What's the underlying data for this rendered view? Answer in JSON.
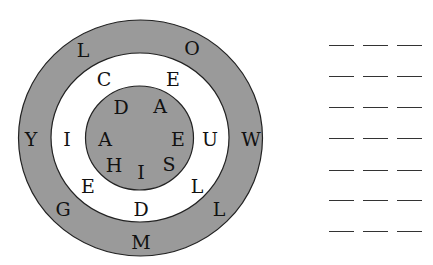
{
  "puzzle": {
    "rings": [
      {
        "name": "outer-ring",
        "cx": 140.5,
        "cy": 138,
        "rx": 122,
        "ry": 118,
        "fill": "#9a9a9a"
      },
      {
        "name": "middle-ring",
        "cx": 140,
        "cy": 137.5,
        "rx": 89,
        "ry": 84.5,
        "fill": "#ffffff"
      },
      {
        "name": "inner-circle",
        "cx": 139.5,
        "cy": 138,
        "rx": 54,
        "ry": 52,
        "fill": "#9a9a9a"
      }
    ],
    "letters": [
      {
        "ch": "L",
        "x": 83,
        "y": 50,
        "ring": "outer"
      },
      {
        "ch": "O",
        "x": 192,
        "y": 48,
        "ring": "outer"
      },
      {
        "ch": "W",
        "x": 251,
        "y": 139,
        "ring": "outer"
      },
      {
        "ch": "L",
        "x": 219,
        "y": 209,
        "ring": "outer"
      },
      {
        "ch": "M",
        "x": 141,
        "y": 242,
        "ring": "outer"
      },
      {
        "ch": "G",
        "x": 63,
        "y": 209,
        "ring": "outer"
      },
      {
        "ch": "Y",
        "x": 31,
        "y": 139,
        "ring": "outer"
      },
      {
        "ch": "C",
        "x": 104,
        "y": 79,
        "ring": "middle"
      },
      {
        "ch": "E",
        "x": 173,
        "y": 79,
        "ring": "middle"
      },
      {
        "ch": "U",
        "x": 210,
        "y": 139,
        "ring": "middle"
      },
      {
        "ch": "L",
        "x": 197,
        "y": 186,
        "ring": "middle"
      },
      {
        "ch": "D",
        "x": 141,
        "y": 209,
        "ring": "middle"
      },
      {
        "ch": "E",
        "x": 88,
        "y": 186,
        "ring": "middle"
      },
      {
        "ch": "I",
        "x": 67,
        "y": 139,
        "ring": "middle"
      },
      {
        "ch": "D",
        "x": 121,
        "y": 107,
        "ring": "inner"
      },
      {
        "ch": "A",
        "x": 160,
        "y": 106,
        "ring": "inner"
      },
      {
        "ch": "E",
        "x": 178,
        "y": 139,
        "ring": "inner"
      },
      {
        "ch": "S",
        "x": 169,
        "y": 164,
        "ring": "inner"
      },
      {
        "ch": "I",
        "x": 141,
        "y": 172,
        "ring": "inner"
      },
      {
        "ch": "H",
        "x": 114,
        "y": 165,
        "ring": "inner"
      },
      {
        "ch": "A",
        "x": 105,
        "y": 139,
        "ring": "inner"
      }
    ]
  },
  "answer_blanks": {
    "rows": [
      45,
      76,
      107,
      138,
      170,
      200,
      231
    ],
    "columns": [
      329,
      363,
      397
    ],
    "blank_width": 25
  }
}
